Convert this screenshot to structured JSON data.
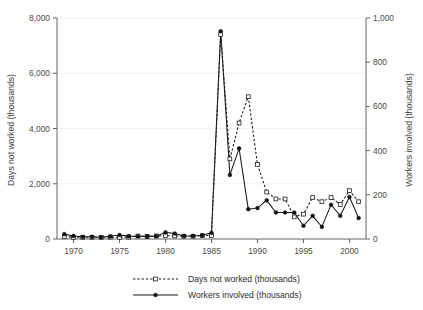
{
  "chart_data": {
    "type": "line",
    "title": "",
    "subtitle": "",
    "xlabel": "",
    "ylabel": "Days not worked (thousands)",
    "y2label": "Workers involved (thousands)",
    "grid": true,
    "legend_position": "bottom-center",
    "xlim": [
      1968.2,
      2001.8
    ],
    "ylim": [
      0,
      8000
    ],
    "y2lim": [
      0,
      1000
    ],
    "xticks": [
      1970,
      1975,
      1980,
      1985,
      1990,
      1995,
      2000
    ],
    "xtick_labels": [
      "1970",
      "1975",
      "1980",
      "1985",
      "1990",
      "1995",
      "2000"
    ],
    "yticks": [
      0,
      2000,
      4000,
      6000,
      8000
    ],
    "ytick_labels": [
      "0",
      "2,000",
      "4,000",
      "6,000",
      "8,000"
    ],
    "y2ticks": [
      0,
      200,
      400,
      600,
      800,
      1000
    ],
    "y2tick_labels": [
      "0",
      "200",
      "400",
      "600",
      "800",
      "1,000"
    ],
    "x": [
      1969,
      1970,
      1971,
      1972,
      1973,
      1974,
      1975,
      1976,
      1977,
      1978,
      1979,
      1980,
      1981,
      1982,
      1983,
      1984,
      1985,
      1986,
      1987,
      1988,
      1989,
      1990,
      1991,
      1992,
      1993,
      1994,
      1995,
      1996,
      1997,
      1998,
      1999,
      2000,
      2001
    ],
    "series": [
      {
        "name": "Days not worked (thousands)",
        "axis": "left",
        "marker": "open-square",
        "line_style": "dashed",
        "color": "#111111",
        "values": [
          90,
          60,
          60,
          60,
          60,
          70,
          60,
          70,
          110,
          90,
          110,
          120,
          110,
          100,
          100,
          120,
          130,
          7400,
          2900,
          4200,
          5150,
          2700,
          1700,
          1450,
          1450,
          800,
          900,
          1500,
          1350,
          1500,
          1250,
          1750,
          1350
        ]
      },
      {
        "name": "Workers involved (thousands)",
        "axis": "right",
        "marker": "filled-circle",
        "line_style": "solid",
        "color": "#111111",
        "values": [
          22,
          14,
          10,
          10,
          8,
          12,
          18,
          13,
          12,
          12,
          13,
          30,
          25,
          14,
          14,
          17,
          28,
          940,
          290,
          410,
          135,
          140,
          175,
          120,
          120,
          120,
          60,
          105,
          55,
          155,
          105,
          190,
          95
        ]
      }
    ],
    "legend": [
      {
        "label": "Days not worked (thousands)",
        "line_style": "dashed",
        "marker": "open-square"
      },
      {
        "label": "Workers involved (thousands)",
        "line_style": "solid",
        "marker": "filled-circle"
      }
    ]
  }
}
